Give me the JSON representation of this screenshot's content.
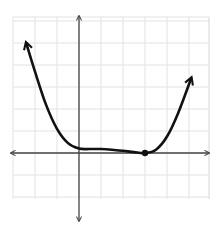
{
  "chart_data": {
    "type": "line",
    "title": "",
    "xlabel": "",
    "ylabel": "",
    "grid": true,
    "xlim": [
      -3,
      6
    ],
    "ylim": [
      -2,
      6
    ],
    "tick_labels": "none",
    "series": [
      {
        "name": "polynomial curve",
        "x": [
          -2.4,
          -2.0,
          -1.5,
          -1.0,
          -0.5,
          0.0,
          0.5,
          1.0,
          1.5,
          2.0,
          2.5,
          3.0,
          3.5,
          4.0,
          4.5,
          5.1
        ],
        "y": [
          5.0,
          3.7,
          2.2,
          1.1,
          0.45,
          0.2,
          0.18,
          0.18,
          0.15,
          0.1,
          0.04,
          0.0,
          0.15,
          0.75,
          1.8,
          3.4
        ],
        "end_arrows": true
      }
    ],
    "points": [
      {
        "label": "root",
        "x": 3,
        "y": 0
      }
    ],
    "colors": {
      "grid": "#e2e2e2",
      "axis": "#444444",
      "curve": "#111111"
    }
  }
}
